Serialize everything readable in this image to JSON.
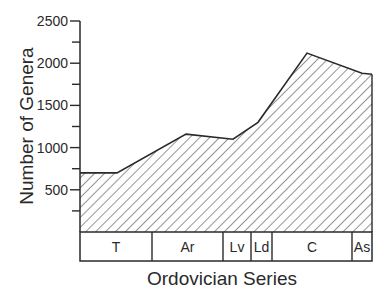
{
  "chart_data": {
    "type": "area",
    "title": "",
    "xlabel": "Ordovician Series",
    "ylabel": "Number of Genera",
    "ylim": [
      0,
      2500
    ],
    "yticks": [
      500,
      1000,
      1500,
      2000,
      2500
    ],
    "grid": false,
    "legend": null,
    "fill_pattern": "diagonal-hatch",
    "x_segments": [
      {
        "label": "T",
        "start_px": 80,
        "end_px": 152
      },
      {
        "label": "Ar",
        "start_px": 152,
        "end_px": 223
      },
      {
        "label": "Lv",
        "start_px": 223,
        "end_px": 251
      },
      {
        "label": "Ld",
        "start_px": 251,
        "end_px": 272
      },
      {
        "label": "C",
        "start_px": 272,
        "end_px": 352
      },
      {
        "label": "As",
        "start_px": 352,
        "end_px": 372
      }
    ],
    "series": [
      {
        "name": "Number of Genera",
        "points": [
          {
            "x_px": 80,
            "value": 700
          },
          {
            "x_px": 117,
            "value": 700
          },
          {
            "x_px": 186,
            "value": 1160
          },
          {
            "x_px": 233,
            "value": 1100
          },
          {
            "x_px": 258,
            "value": 1300
          },
          {
            "x_px": 307,
            "value": 2120
          },
          {
            "x_px": 362,
            "value": 1880
          },
          {
            "x_px": 372,
            "value": 1870
          }
        ]
      }
    ]
  }
}
